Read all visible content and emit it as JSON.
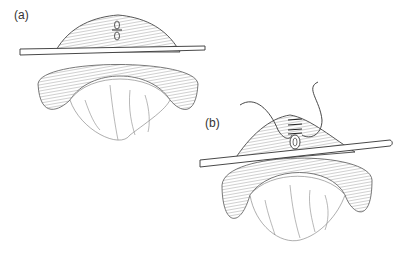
{
  "figure": {
    "panels": [
      {
        "id": "a",
        "label": "(a)",
        "description": "Loop of bowel brought through abdominal wall supported by a rod, with longitudinal incision marked on the apex"
      },
      {
        "id": "b",
        "label": "(b)",
        "description": "Loop of bowel on rod with sutures placed across the opened stoma"
      }
    ]
  },
  "colors": {
    "line": "#3a3a3a",
    "hatch": "#8a8a8a",
    "background": "#ffffff"
  }
}
